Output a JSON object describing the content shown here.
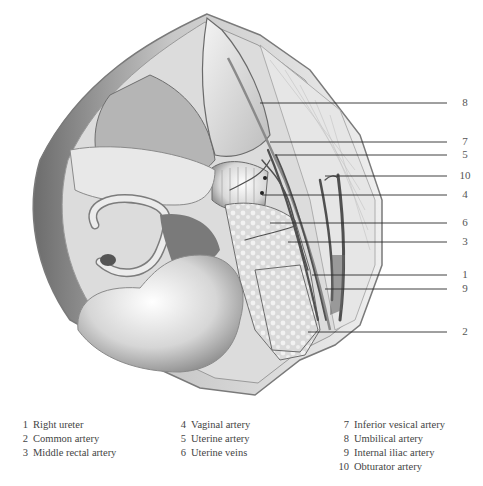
{
  "figure": {
    "callouts": [
      {
        "num": "8",
        "y": 103,
        "x_start": 260
      },
      {
        "num": "7",
        "y": 142,
        "x_start": 270
      },
      {
        "num": "5",
        "y": 155,
        "x_start": 275
      },
      {
        "num": "10",
        "y": 176,
        "x_start": 325
      },
      {
        "num": "4",
        "y": 195,
        "x_start": 262
      },
      {
        "num": "6",
        "y": 223,
        "x_start": 270
      },
      {
        "num": "3",
        "y": 242,
        "x_start": 288
      },
      {
        "num": "1",
        "y": 275,
        "x_start": 312
      },
      {
        "num": "9",
        "y": 289,
        "x_start": 325
      },
      {
        "num": "2",
        "y": 332,
        "x_start": 308
      }
    ],
    "line_end_x": 447,
    "label_x": 465
  },
  "legend": {
    "columns": [
      [
        {
          "num": "1",
          "label": "Right ureter"
        },
        {
          "num": "2",
          "label": "Common artery"
        },
        {
          "num": "3",
          "label": "Middle rectal artery"
        }
      ],
      [
        {
          "num": "4",
          "label": "Vaginal artery"
        },
        {
          "num": "5",
          "label": "Uterine artery"
        },
        {
          "num": "6",
          "label": "Uterine veins"
        }
      ],
      [
        {
          "num": "7",
          "label": "Inferior vesical artery"
        },
        {
          "num": "8",
          "label": "Umbilical artery"
        },
        {
          "num": "9",
          "label": "Internal iliac artery"
        },
        {
          "num": "10",
          "label": "Obturator artery"
        }
      ]
    ]
  }
}
